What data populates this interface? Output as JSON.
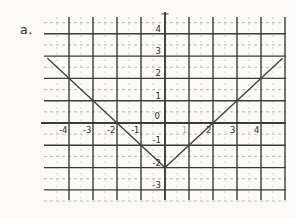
{
  "label": "a.",
  "colors": {
    "background": "#fbfaf6",
    "major_grid": "#3b3b3b",
    "minor_grid": "#a5a5a5",
    "minor_grid_v": "#bfbfbf",
    "curve": "#3f3f3f",
    "label": "#2b2b2b"
  },
  "chart_data": {
    "type": "line",
    "title": "",
    "xlabel": "",
    "ylabel": "",
    "function": "y = |x| - 2",
    "vertex": [
      0,
      -2
    ],
    "series": [
      {
        "name": "absolute-value-v",
        "points": [
          [
            -4.9,
            2.9
          ],
          [
            0,
            -2
          ],
          [
            4.9,
            2.9
          ]
        ]
      }
    ],
    "x_ticks": [
      {
        "value": -4,
        "label": "-4"
      },
      {
        "value": -3,
        "label": "-3"
      },
      {
        "value": -2,
        "label": "-2"
      },
      {
        "value": -1,
        "label": "-1"
      },
      {
        "value": 1,
        "label": "1",
        "faint": true
      },
      {
        "value": 2,
        "label": "2"
      },
      {
        "value": 3,
        "label": "3"
      },
      {
        "value": 4,
        "label": "4"
      }
    ],
    "y_ticks": [
      {
        "value": 4,
        "label": "4"
      },
      {
        "value": 3,
        "label": "3"
      },
      {
        "value": 2,
        "label": "2"
      },
      {
        "value": 1,
        "label": "1"
      },
      {
        "value": -1,
        "label": "-1"
      },
      {
        "value": -2,
        "label": "-2"
      },
      {
        "value": -3,
        "label": "-3"
      }
    ],
    "origin_label": "0",
    "xlim": [
      -5,
      5
    ],
    "ylim": [
      -3.5,
      4.5
    ],
    "grid": {
      "major_step": 1,
      "minor_step": 0.5,
      "minor_style": "dashed",
      "legend": "none"
    }
  }
}
